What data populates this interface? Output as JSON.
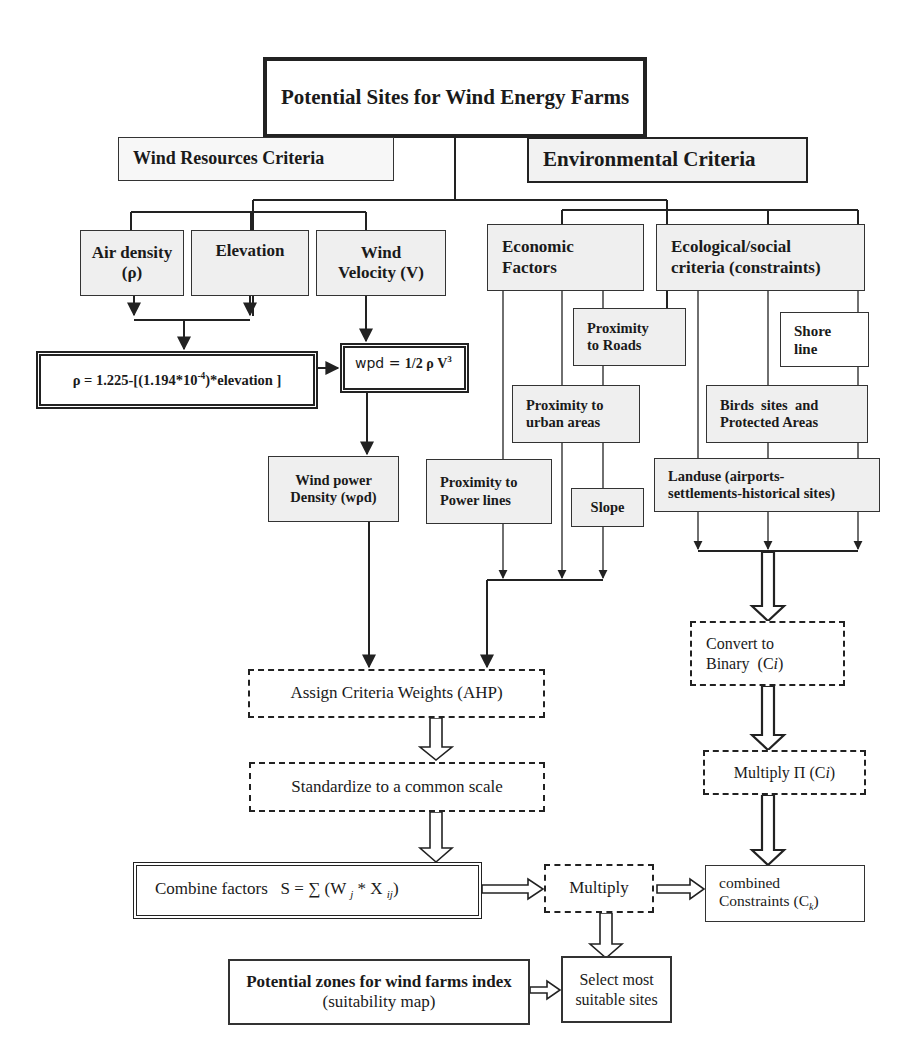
{
  "diagram": {
    "title": "Potential Sites for Wind Energy Farms",
    "wind_resources": {
      "label": "Wind Resources Criteria",
      "air_density": {
        "line1": "Air density",
        "line2": "(ρ)"
      },
      "elevation": "Elevation",
      "wind_velocity": {
        "line1": "Wind",
        "line2": "Velocity (V)"
      },
      "rho_formula": {
        "prefix": "ρ = 1.225-[(1.194*10",
        "exp": "-4",
        "suffix": ")*elevation ]"
      },
      "wpd_formula": {
        "prefix": "wpd = ",
        "bold": "1/2 ρ V",
        "exp": "3"
      },
      "wind_power_density": {
        "line1": "Wind power",
        "line2": "Density (wρd)"
      }
    },
    "environmental": {
      "label": "Environmental Criteria",
      "economic": {
        "label_line1": "Economic",
        "label_line2": "Factors",
        "proximity_roads": {
          "line1": "Proximity",
          "line2": "to Roads"
        },
        "proximity_urban": {
          "line1": "Proximity to",
          "line2": "urban areas"
        },
        "proximity_power": {
          "line1": "Proximity to",
          "line2": "Power lines"
        },
        "slope": "Slope"
      },
      "ecological": {
        "label_line1": "Ecological/social",
        "label_line2": "criteria (constraints)",
        "shore_line": {
          "line1": "Shore",
          "line2": "line"
        },
        "birds": {
          "line1": "Birds  sites  and",
          "line2": "Protected Areas"
        },
        "landuse": {
          "line1": "Landuse (airports-",
          "line2": "settlements-historical sites)"
        }
      }
    },
    "process": {
      "assign_weights": "Assign Criteria Weights (AHP)",
      "standardize": "Standardize to a common scale",
      "combine": {
        "label": "Combine factors",
        "formula_prefix": "S = ∑ (W ",
        "sub_j": "j",
        "mid": " * X ",
        "sub_ij": "ij",
        "suffix": ")"
      },
      "multiply": "Multiply",
      "convert_binary": {
        "line1": "Convert to",
        "line2_prefix": "Binary  (C",
        "line2_italic": "i",
        "line2_suffix": ")"
      },
      "multiply_pi": {
        "prefix": "Multiply Π (C",
        "italic": "i",
        "suffix": ")"
      },
      "combined_constraints": {
        "line1": "combined",
        "line2_prefix": "Constraints (C",
        "sub": "k",
        "line2_suffix": ")"
      },
      "potential_zones": {
        "line1": "Potential zones for wind farms index",
        "line2": "(suitability map)"
      },
      "select_sites": {
        "line1": "Select most",
        "line2": "suitable sites"
      }
    },
    "colors": {
      "line": "#222222",
      "box_fill": "#efefef",
      "background": "#ffffff"
    }
  }
}
